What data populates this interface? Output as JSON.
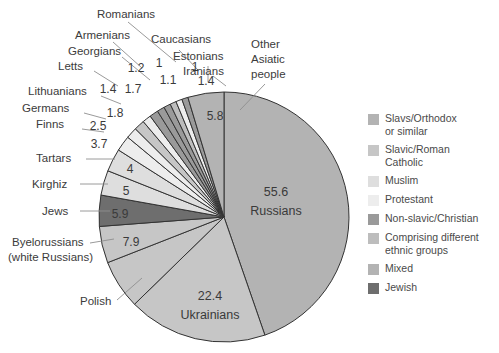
{
  "chart_data": {
    "type": "pie",
    "title": "",
    "xlabel": "",
    "ylabel": "",
    "units": "percent",
    "categories": [
      "Russians",
      "Ukrainians",
      "Polish",
      "Byelorussians (white Russians)",
      "Jews",
      "Kirghiz",
      "Tartars",
      "Finns",
      "Germans",
      "Lithuanians",
      "Letts",
      "Georgians",
      "Armenians",
      "Romanians",
      "Caucasians",
      "Estonians",
      "Iranians",
      "Other Asiatic people"
    ],
    "values": [
      55.6,
      22.4,
      7.9,
      5.9,
      5,
      4,
      3.7,
      2.5,
      1.8,
      1.7,
      1.4,
      1.4,
      1.2,
      1.1,
      1,
      1,
      1,
      5.8
    ],
    "slice_groups": [
      "Slavs/Orthodox or similar",
      "Slavs/Orthodox or similar",
      "Slavic/Roman Catholic",
      "Slavs/Orthodox or similar",
      "Jewish",
      "Muslim",
      "Muslim",
      "Protestant",
      "Protestant",
      "Slavic/Roman Catholic",
      "Protestant",
      "Non-slavic/Christian",
      "Non-slavic/Christian",
      "Non-slavic/Christian",
      "Comprising different ethnic groups",
      "Protestant",
      "Non-slavic/Christian",
      "Mixed"
    ],
    "legend_position": "right",
    "grid": false
  },
  "slices": [
    {
      "name": "Russians",
      "value_label": "55.6",
      "name_label": "Russians",
      "color": "#b3b3b3"
    },
    {
      "name": "Ukrainians",
      "value_label": "22.4",
      "name_label": "Ukrainians",
      "color": "#c6c6c6"
    },
    {
      "name": "Polish",
      "value_label": "7.9",
      "name_label": "Polish",
      "color": "#c6c6c6"
    },
    {
      "name": "Byelorussians",
      "value_label": "5.9",
      "name_label": "Byelorussians\n(white Russians)",
      "color": "#c6c6c6"
    },
    {
      "name": "Jews",
      "value_label": "5",
      "name_label": "Jews",
      "color": "#6e6e6e"
    },
    {
      "name": "Kirghiz",
      "value_label": "4",
      "name_label": "Kirghiz",
      "color": "#dedede"
    },
    {
      "name": "Tartars",
      "value_label": "3.7",
      "name_label": "Tartars",
      "color": "#dedede"
    },
    {
      "name": "Finns",
      "value_label": "2.5",
      "name_label": "Finns",
      "color": "#ededed"
    },
    {
      "name": "Germans",
      "value_label": "1.8",
      "name_label": "Germans",
      "color": "#ededed"
    },
    {
      "name": "Lithuanians",
      "value_label": "1.7",
      "name_label": "Lithuanians",
      "color": "#c6c6c6"
    },
    {
      "name": "Letts",
      "value_label": "1.4",
      "name_label": "Letts",
      "color": "#ededed"
    },
    {
      "name": "Georgians",
      "value_label": "1.4",
      "name_label": "Georgians",
      "color": "#9a9a9a"
    },
    {
      "name": "Armenians",
      "value_label": "1.2",
      "name_label": "Armenians",
      "color": "#9a9a9a"
    },
    {
      "name": "Romanians",
      "value_label": "1.1",
      "name_label": "Romanians",
      "color": "#9a9a9a"
    },
    {
      "name": "Caucasians",
      "value_label": "1",
      "name_label": "Caucasians",
      "color": "#bdbdbd"
    },
    {
      "name": "Estonians",
      "value_label": "1",
      "name_label": "Estonians",
      "color": "#ededed"
    },
    {
      "name": "Iranians",
      "value_label": "1",
      "name_label": "Iranians",
      "color": "#9a9a9a"
    },
    {
      "name": "Other Asiatic",
      "value_label": "5.8",
      "name_label": "Other\nAsiatic\npeople",
      "color": "#b3b3b3"
    }
  ],
  "labels": {
    "romanians": "Romanians",
    "caucasians": "Caucasians",
    "armenians": "Armenians",
    "estonians": "Estonians",
    "georgians": "Georgians",
    "iranians": "Iranians",
    "letts": "Letts",
    "lithuanians": "Lithuanians",
    "germans": "Germans",
    "finns": "Finns",
    "tartars": "Tartars",
    "kirghiz": "Kirghiz",
    "jews": "Jews",
    "byelorussians_line1": "Byelorussians",
    "byelorussians_line2": "(white Russians)",
    "polish": "Polish",
    "other_asiatic_line1": "Other",
    "other_asiatic_line2": "Asiatic",
    "other_asiatic_line3": "people",
    "russians": "Russians",
    "ukrainians": "Ukrainians"
  },
  "values": {
    "romanians": "1.2",
    "caucasians": "1.1",
    "estonians": "1",
    "iranians": "1",
    "armenians": "1.4",
    "georgians": "1.4",
    "letts": "1.7",
    "lithuanians": "1.8",
    "germans": "2.5",
    "finns": "3.7",
    "tartars": "4",
    "kirghiz": "5",
    "jews": "5.9",
    "byelorussians": "7.9",
    "other_asiatic": "5.8",
    "russians": "55.6",
    "ukrainians": "22.4"
  },
  "legend": {
    "items": [
      {
        "label": "Slavs/Orthodox\nor similar",
        "color": "#b3b3b3"
      },
      {
        "label": "Slavic/Roman\nCatholic",
        "color": "#c6c6c6"
      },
      {
        "label": "Muslim",
        "color": "#dedede"
      },
      {
        "label": "Protestant",
        "color": "#ededed"
      },
      {
        "label": "Non-slavic/Christian",
        "color": "#9a9a9a"
      },
      {
        "label": "Comprising different\nethnic groups",
        "color": "#bdbdbd"
      },
      {
        "label": "Mixed",
        "color": "#b3b3b3"
      },
      {
        "label": "Jewish",
        "color": "#6e6e6e"
      }
    ]
  }
}
